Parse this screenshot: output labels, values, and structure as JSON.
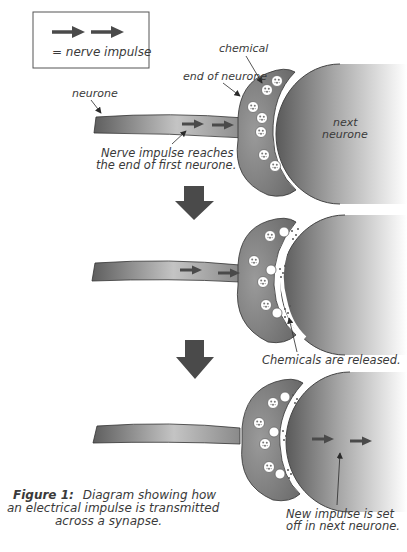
{
  "legend": {
    "label": "= nerve impulse",
    "icon": "double-arrow-icon"
  },
  "stage1": {
    "labels": {
      "chemical": "chemical",
      "end_of_neurone": "end of neurone",
      "neurone": "neurone",
      "next_neurone_line1": "next",
      "next_neurone_line2": "neurone",
      "caption_line1": "Nerve impulse reaches",
      "caption_line2": "the end of first neurone."
    }
  },
  "stage2": {
    "labels": {
      "caption": "Chemicals are released."
    }
  },
  "stage3": {
    "labels": {
      "caption_line1": "New impulse is set",
      "caption_line2": "off in next neurone."
    }
  },
  "figure_caption": {
    "number": "Figure 1:",
    "line1": "Diagram showing how",
    "line2": "an electrical impulse is transmitted",
    "line3": "across a synapse."
  },
  "colors": {
    "neurone_dark": "#5a5a5a",
    "neurone_light": "#bdbdbd",
    "arrow": "#4a4a4a",
    "text": "#3a3a3a"
  }
}
